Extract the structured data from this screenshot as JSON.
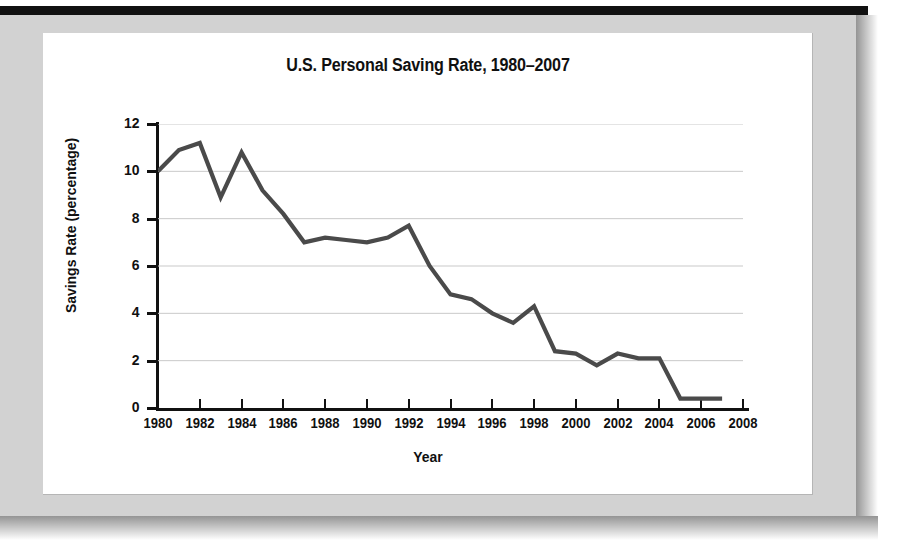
{
  "figure": {
    "title": "U.S. Personal Saving Rate, 1980–2007",
    "x_axis_title": "Year",
    "y_axis_title": "Savings Rate (percentage)"
  },
  "colors": {
    "line": "#4a4a4a",
    "gridline": "#c9c9c9",
    "axis": "#111111",
    "mat": "#d2d2d2",
    "top_rule": "#111111",
    "plot_background": "#ffffff"
  },
  "chart_data": {
    "type": "line",
    "title": "U.S. Personal Saving Rate, 1980–2007",
    "xlabel": "Year",
    "ylabel": "Savings Rate (percentage)",
    "xlim": [
      1980,
      2008
    ],
    "ylim": [
      0,
      12
    ],
    "grid": "horizontal",
    "legend": null,
    "y_ticks": [
      0,
      2,
      4,
      6,
      8,
      10,
      12
    ],
    "y_tick_labels": [
      "0",
      "2",
      "4",
      "6",
      "8",
      "10",
      "12"
    ],
    "x_ticks": [
      1980,
      1982,
      1984,
      1986,
      1988,
      1990,
      1992,
      1994,
      1996,
      1998,
      2000,
      2002,
      2004,
      2006,
      2008
    ],
    "x_tick_labels": [
      "1980",
      "1982",
      "1984",
      "1986",
      "1988",
      "1990",
      "1992",
      "1994",
      "1996",
      "1998",
      "2000",
      "2002",
      "2004",
      "2006",
      "2008"
    ],
    "x": [
      1980,
      1981,
      1982,
      1983,
      1984,
      1985,
      1986,
      1987,
      1988,
      1989,
      1990,
      1991,
      1992,
      1993,
      1994,
      1995,
      1996,
      1997,
      1998,
      1999,
      2000,
      2001,
      2002,
      2003,
      2004,
      2005,
      2006,
      2007
    ],
    "series": [
      {
        "name": "U.S. Personal Saving Rate",
        "values": [
          10.0,
          10.9,
          11.2,
          8.9,
          10.8,
          9.2,
          8.2,
          7.0,
          7.2,
          7.1,
          7.0,
          7.2,
          7.7,
          6.0,
          4.8,
          4.6,
          4.0,
          3.6,
          4.3,
          2.4,
          2.3,
          1.8,
          2.3,
          2.1,
          2.1,
          0.4,
          0.4,
          0.4
        ]
      }
    ]
  }
}
